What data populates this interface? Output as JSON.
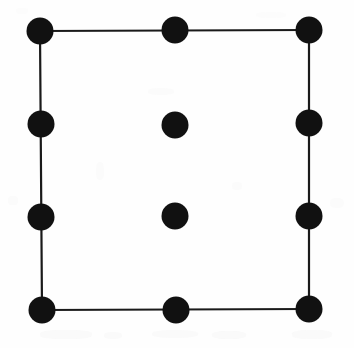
{
  "figure": {
    "canvas": {
      "width": 354,
      "height": 348
    },
    "background_color": "#fefefe",
    "ink_color": "#111111",
    "line_color": "#1a1a1a",
    "line_width": 2.2,
    "dot_radius": 13.5,
    "dot_count": 12,
    "edge_count": 4,
    "nodes": [
      {
        "id": "corner-top-left",
        "label": "top-left corner",
        "x": 40,
        "y": 31,
        "r": 13.5,
        "on_outline": true
      },
      {
        "id": "edge-top-mid",
        "label": "top edge midpoint",
        "x": 175,
        "y": 30,
        "r": 13.5,
        "on_outline": true
      },
      {
        "id": "corner-top-right",
        "label": "top-right corner",
        "x": 309,
        "y": 30,
        "r": 13.5,
        "on_outline": true
      },
      {
        "id": "edge-left-upper",
        "label": "left edge upper third",
        "x": 41,
        "y": 124,
        "r": 13.5,
        "on_outline": true
      },
      {
        "id": "edge-right-upper",
        "label": "right edge upper third",
        "x": 309,
        "y": 123,
        "r": 13.5,
        "on_outline": true
      },
      {
        "id": "edge-left-lower",
        "label": "left edge lower third",
        "x": 41,
        "y": 217,
        "r": 13.5,
        "on_outline": true
      },
      {
        "id": "edge-right-lower",
        "label": "right edge lower third",
        "x": 309,
        "y": 216,
        "r": 13.5,
        "on_outline": true
      },
      {
        "id": "corner-bottom-left",
        "label": "bottom-left corner",
        "x": 42,
        "y": 310,
        "r": 13.5,
        "on_outline": true
      },
      {
        "id": "edge-bottom-mid",
        "label": "bottom edge midpoint",
        "x": 176,
        "y": 310,
        "r": 13.5,
        "on_outline": true
      },
      {
        "id": "corner-bottom-right",
        "label": "bottom-right corner",
        "x": 309,
        "y": 309,
        "r": 13.5,
        "on_outline": true
      },
      {
        "id": "interior-upper",
        "label": "interior upper point",
        "x": 175,
        "y": 125,
        "r": 13.5,
        "on_outline": false
      },
      {
        "id": "interior-lower",
        "label": "interior lower point",
        "x": 175,
        "y": 216,
        "r": 13.5,
        "on_outline": false
      }
    ],
    "edges": [
      {
        "id": "edge-top",
        "label": "top side",
        "x1": 40,
        "y1": 31,
        "x2": 309,
        "y2": 30
      },
      {
        "id": "edge-right",
        "label": "right side",
        "x1": 309,
        "y1": 30,
        "x2": 309,
        "y2": 309
      },
      {
        "id": "edge-bottom",
        "label": "bottom side",
        "x1": 309,
        "y1": 309,
        "x2": 42,
        "y2": 310
      },
      {
        "id": "edge-left",
        "label": "left side",
        "x1": 42,
        "y1": 310,
        "x2": 40,
        "y2": 31
      }
    ],
    "scan_artifacts": [
      {
        "x": 40,
        "y": 330,
        "w": 52,
        "h": 9,
        "opacity": 0.55
      },
      {
        "x": 104,
        "y": 332,
        "w": 18,
        "h": 7,
        "opacity": 0.45
      },
      {
        "x": 152,
        "y": 330,
        "w": 46,
        "h": 8,
        "opacity": 0.4
      },
      {
        "x": 212,
        "y": 331,
        "w": 34,
        "h": 8,
        "opacity": 0.5
      },
      {
        "x": 292,
        "y": 330,
        "w": 40,
        "h": 9,
        "opacity": 0.55
      },
      {
        "x": 148,
        "y": 88,
        "w": 26,
        "h": 7,
        "opacity": 0.35
      },
      {
        "x": 96,
        "y": 162,
        "w": 8,
        "h": 18,
        "opacity": 0.3
      },
      {
        "x": 232,
        "y": 182,
        "w": 10,
        "h": 8,
        "opacity": 0.3
      },
      {
        "x": 330,
        "y": 198,
        "w": 14,
        "h": 10,
        "opacity": 0.3
      },
      {
        "x": 8,
        "y": 196,
        "w": 10,
        "h": 9,
        "opacity": 0.3
      },
      {
        "x": 16,
        "y": 8,
        "w": 12,
        "h": 6,
        "opacity": 0.25
      },
      {
        "x": 256,
        "y": 12,
        "w": 30,
        "h": 6,
        "opacity": 0.25
      }
    ]
  }
}
